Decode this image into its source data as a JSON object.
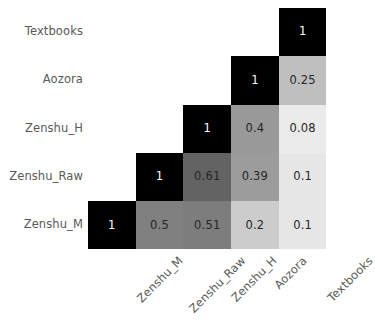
{
  "chart_data": {
    "type": "heatmap",
    "title": "",
    "subtitle": "",
    "xlabel": "",
    "ylabel": "",
    "grid": false,
    "legend": "none",
    "colormap": "grayscale-reversed",
    "colormap_note": "higher value = darker cell; 1 = black, 0 = white",
    "vmin": 0,
    "vmax": 1,
    "mask": "lower-triangle-shown",
    "x_categories": [
      "Zenshu_M",
      "Zenshu_Raw",
      "Zenshu_H",
      "Aozora",
      "Textbooks"
    ],
    "y_categories": [
      "Textbooks",
      "Aozora",
      "Zenshu_H",
      "Zenshu_Raw",
      "Zenshu_M"
    ],
    "x_tick_rotation": -45,
    "rows": [
      {
        "label": "Textbooks",
        "cells": [
          {
            "col": "Zenshu_M",
            "value": null,
            "text": ""
          },
          {
            "col": "Zenshu_Raw",
            "value": null,
            "text": ""
          },
          {
            "col": "Zenshu_H",
            "value": null,
            "text": ""
          },
          {
            "col": "Aozora",
            "value": null,
            "text": ""
          },
          {
            "col": "Textbooks",
            "value": 1,
            "text": "1"
          }
        ]
      },
      {
        "label": "Aozora",
        "cells": [
          {
            "col": "Zenshu_M",
            "value": null,
            "text": ""
          },
          {
            "col": "Zenshu_Raw",
            "value": null,
            "text": ""
          },
          {
            "col": "Zenshu_H",
            "value": null,
            "text": ""
          },
          {
            "col": "Aozora",
            "value": 1,
            "text": "1"
          },
          {
            "col": "Textbooks",
            "value": 0.25,
            "text": "0.25"
          }
        ]
      },
      {
        "label": "Zenshu_H",
        "cells": [
          {
            "col": "Zenshu_M",
            "value": null,
            "text": ""
          },
          {
            "col": "Zenshu_Raw",
            "value": null,
            "text": ""
          },
          {
            "col": "Zenshu_H",
            "value": 1,
            "text": "1"
          },
          {
            "col": "Aozora",
            "value": 0.4,
            "text": "0.4"
          },
          {
            "col": "Textbooks",
            "value": 0.08,
            "text": "0.08"
          }
        ]
      },
      {
        "label": "Zenshu_Raw",
        "cells": [
          {
            "col": "Zenshu_M",
            "value": null,
            "text": ""
          },
          {
            "col": "Zenshu_Raw",
            "value": 1,
            "text": "1"
          },
          {
            "col": "Zenshu_H",
            "value": 0.61,
            "text": "0.61"
          },
          {
            "col": "Aozora",
            "value": 0.39,
            "text": "0.39"
          },
          {
            "col": "Textbooks",
            "value": 0.1,
            "text": "0.1"
          }
        ]
      },
      {
        "label": "Zenshu_M",
        "cells": [
          {
            "col": "Zenshu_M",
            "value": 1,
            "text": "1"
          },
          {
            "col": "Zenshu_Raw",
            "value": 0.5,
            "text": "0.5"
          },
          {
            "col": "Zenshu_H",
            "value": 0.51,
            "text": "0.51"
          },
          {
            "col": "Aozora",
            "value": 0.2,
            "text": "0.2"
          },
          {
            "col": "Textbooks",
            "value": 0.1,
            "text": "0.1"
          }
        ]
      }
    ]
  },
  "style": {
    "tick_label_color": "#595959",
    "dark_cell_text_color": "#ffffff",
    "light_cell_text_color": "#262626",
    "background": "#ffffff"
  }
}
